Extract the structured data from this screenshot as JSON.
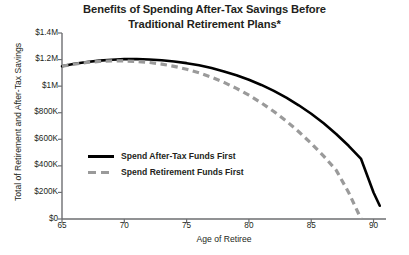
{
  "chart_data": {
    "type": "line",
    "title": "Benefits of Spending After-Tax Savings Before Traditional Retirement Plans*",
    "title_lines": [
      "Benefits of Spending After-Tax Savings Before",
      "Traditional Retirement Plans*"
    ],
    "xlabel": "Age of Retiree",
    "ylabel": "Total of Retirement and After-Tax Savings",
    "xlim": [
      65,
      91
    ],
    "ylim": [
      0,
      1400000
    ],
    "xticks": [
      65,
      70,
      75,
      80,
      85,
      90
    ],
    "xtick_labels": [
      "65",
      "70",
      "75",
      "80",
      "85",
      "90"
    ],
    "yticks": [
      0,
      200000,
      400000,
      600000,
      800000,
      1000000,
      1200000,
      1400000
    ],
    "ytick_labels": [
      "$0",
      "$200K",
      "$400K",
      "$600K",
      "$800K",
      "$1M",
      "$1.2M",
      "$1.4M"
    ],
    "grid": false,
    "legend_position": "inside-left-lower",
    "series": [
      {
        "name": "Spend After-Tax Funds First",
        "style": "solid",
        "color": "#000000",
        "x": [
          65,
          66,
          67,
          68,
          69,
          70,
          71,
          72,
          73,
          74,
          75,
          76,
          77,
          78,
          79,
          80,
          81,
          82,
          83,
          84,
          85,
          86,
          87,
          88,
          89,
          90,
          90.5
        ],
        "values": [
          1150000,
          1168000,
          1182000,
          1192000,
          1199000,
          1203000,
          1204000,
          1201000,
          1195000,
          1186000,
          1173000,
          1157000,
          1136000,
          1111000,
          1082000,
          1048000,
          1009000,
          964000,
          913000,
          856000,
          792000,
          720000,
          640000,
          551000,
          452000,
          200000,
          100000
        ]
      },
      {
        "name": "Spend Retirement Funds First",
        "style": "dashed",
        "color": "#9a9a9a",
        "x": [
          65,
          66,
          67,
          68,
          69,
          70,
          71,
          72,
          73,
          74,
          75,
          76,
          77,
          78,
          79,
          80,
          81,
          82,
          83,
          84,
          85,
          86,
          87,
          88,
          89
        ],
        "values": [
          1150000,
          1166000,
          1178000,
          1186000,
          1190000,
          1190000,
          1186000,
          1178000,
          1166000,
          1149000,
          1127000,
          1100000,
          1067000,
          1028000,
          983000,
          932000,
          874000,
          809000,
          737000,
          657000,
          569000,
          473000,
          368000,
          200000,
          0
        ]
      }
    ]
  }
}
